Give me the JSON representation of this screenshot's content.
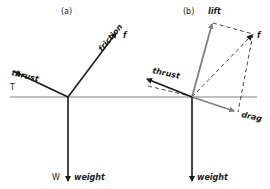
{
  "diagram": {
    "panels": [
      {
        "id": "a",
        "label": "(a)",
        "forces": {
          "thrust": {
            "label": "thrust",
            "symbol": "T"
          },
          "friction": {
            "label": "friction",
            "symbol": "f"
          },
          "weight": {
            "label": "weight",
            "symbol": "W"
          }
        }
      },
      {
        "id": "b",
        "label": "(b)",
        "forces": {
          "lift": {
            "label": "lift"
          },
          "resultant": {
            "symbol": "f"
          },
          "thrust": {
            "label": "thrust"
          },
          "drag": {
            "label": "drag"
          },
          "weight": {
            "label": "weight"
          }
        }
      }
    ],
    "colors": {
      "primary_line": "#1a1a1a",
      "secondary_line": "#808080",
      "dashed_line": "#333333"
    }
  }
}
